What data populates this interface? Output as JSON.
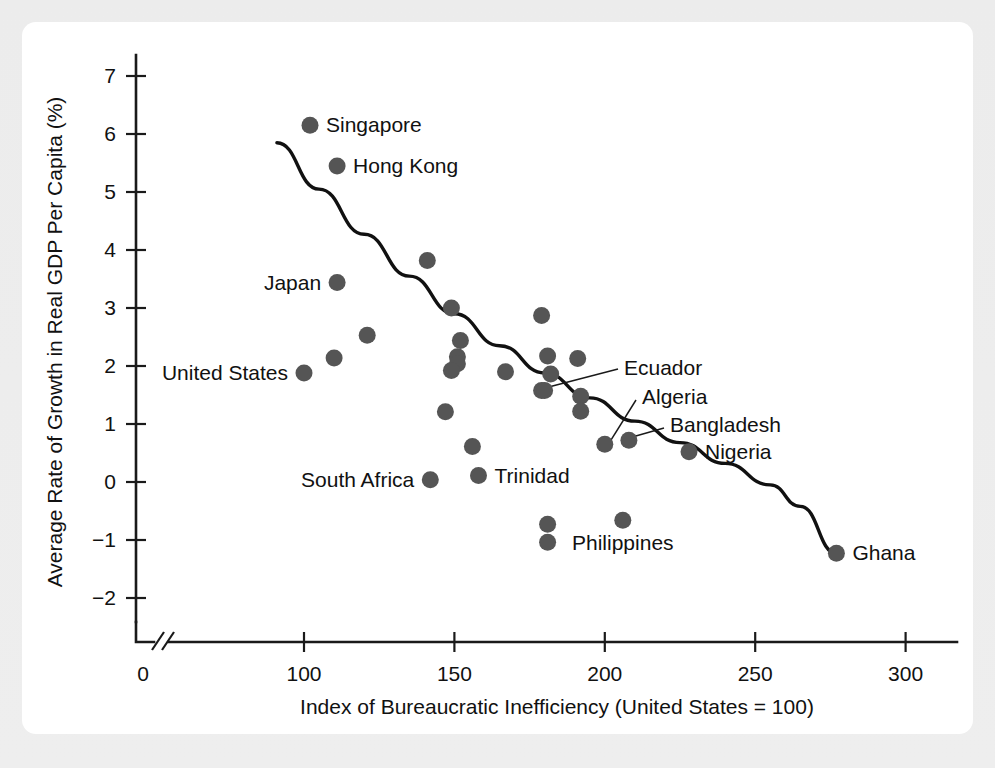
{
  "figure": {
    "background_color": "#e9e9e9",
    "card_color": "#ffffff",
    "dot_color": "#555555",
    "line_color": "#111111"
  },
  "chart_data": {
    "type": "scatter",
    "title": "",
    "xlabel": "Index of Bureaucratic Inefficiency (United States = 100)",
    "ylabel": "Average Rate of Growth in Real GDP Per Capita (%)",
    "xlim": [
      0,
      300
    ],
    "ylim": [
      -2.6,
      7.4
    ],
    "xticks": [
      0,
      100,
      150,
      200,
      250,
      300
    ],
    "xtick_labels": [
      "0",
      "100",
      "150",
      "200",
      "250",
      "300"
    ],
    "yticks": [
      -2,
      -1,
      0,
      1,
      2,
      3,
      4,
      5,
      6,
      7
    ],
    "ytick_labels": [
      "−2",
      "−1",
      "0",
      "1",
      "2",
      "3",
      "4",
      "5",
      "6",
      "7"
    ],
    "grid": false,
    "legend": "none",
    "axis_break": true,
    "axis_break_note": "x-axis broken between 0 and ~95",
    "points": [
      {
        "label": "Singapore",
        "x": 102,
        "y": 6.15,
        "label_pos": "right"
      },
      {
        "label": "Hong Kong",
        "x": 111,
        "y": 5.45,
        "label_pos": "right"
      },
      {
        "label": "Japan",
        "x": 111,
        "y": 3.44,
        "label_pos": "left"
      },
      {
        "label": "United States",
        "x": 100,
        "y": 1.88,
        "label_pos": "left"
      },
      {
        "label": "",
        "x": 110,
        "y": 2.14,
        "label_pos": "none"
      },
      {
        "label": "",
        "x": 121,
        "y": 2.53,
        "label_pos": "none"
      },
      {
        "label": "",
        "x": 141,
        "y": 3.82,
        "label_pos": "none"
      },
      {
        "label": "",
        "x": 149,
        "y": 3.0,
        "label_pos": "none"
      },
      {
        "label": "",
        "x": 152,
        "y": 2.44,
        "label_pos": "none"
      },
      {
        "label": "",
        "x": 151,
        "y": 2.16,
        "label_pos": "none"
      },
      {
        "label": "",
        "x": 151,
        "y": 2.04,
        "label_pos": "none"
      },
      {
        "label": "",
        "x": 149,
        "y": 1.92,
        "label_pos": "none"
      },
      {
        "label": "",
        "x": 147,
        "y": 1.21,
        "label_pos": "none"
      },
      {
        "label": "",
        "x": 156,
        "y": 0.61,
        "label_pos": "none"
      },
      {
        "label": "",
        "x": 167,
        "y": 1.9,
        "label_pos": "none"
      },
      {
        "label": "",
        "x": 179,
        "y": 2.87,
        "label_pos": "none"
      },
      {
        "label": "",
        "x": 181,
        "y": 2.17,
        "label_pos": "none"
      },
      {
        "label": "",
        "x": 182,
        "y": 1.86,
        "label_pos": "none"
      },
      {
        "label": "",
        "x": 179,
        "y": 1.58,
        "label_pos": "none"
      },
      {
        "label": "",
        "x": 191,
        "y": 2.13,
        "label_pos": "none"
      },
      {
        "label": "",
        "x": 192,
        "y": 1.48,
        "label_pos": "none"
      },
      {
        "label": "",
        "x": 192,
        "y": 1.22,
        "label_pos": "none"
      },
      {
        "label": "South Africa",
        "x": 142,
        "y": 0.04,
        "label_pos": "left"
      },
      {
        "label": "Trinidad",
        "x": 158,
        "y": 0.11,
        "label_pos": "right"
      },
      {
        "label": "Ecuador",
        "x": 180,
        "y": 1.58,
        "label_pos": "leader"
      },
      {
        "label": "Algeria",
        "x": 200,
        "y": 0.65,
        "label_pos": "leader"
      },
      {
        "label": "Bangladesh",
        "x": 208,
        "y": 0.72,
        "label_pos": "leader"
      },
      {
        "label": "Nigeria",
        "x": 228,
        "y": 0.52,
        "label_pos": "right"
      },
      {
        "label": "",
        "x": 181,
        "y": -0.73,
        "label_pos": "none"
      },
      {
        "label": "",
        "x": 181,
        "y": -1.04,
        "label_pos": "none"
      },
      {
        "label": "Philippines",
        "x": 206,
        "y": -0.66,
        "label_pos": "below"
      },
      {
        "label": "Ghana",
        "x": 277,
        "y": -1.23,
        "label_pos": "right"
      }
    ],
    "fit_curve": {
      "description": "downward-sloping fitted trend curve",
      "points": [
        {
          "x": 91,
          "y": 5.85
        },
        {
          "x": 105,
          "y": 5.05
        },
        {
          "x": 120,
          "y": 4.27
        },
        {
          "x": 135,
          "y": 3.55
        },
        {
          "x": 150,
          "y": 2.9
        },
        {
          "x": 165,
          "y": 2.35
        },
        {
          "x": 180,
          "y": 1.88
        },
        {
          "x": 195,
          "y": 1.45
        },
        {
          "x": 210,
          "y": 1.05
        },
        {
          "x": 225,
          "y": 0.68
        },
        {
          "x": 240,
          "y": 0.32
        },
        {
          "x": 255,
          "y": -0.05
        },
        {
          "x": 265,
          "y": -0.42
        },
        {
          "x": 277,
          "y": -1.23
        }
      ]
    }
  }
}
